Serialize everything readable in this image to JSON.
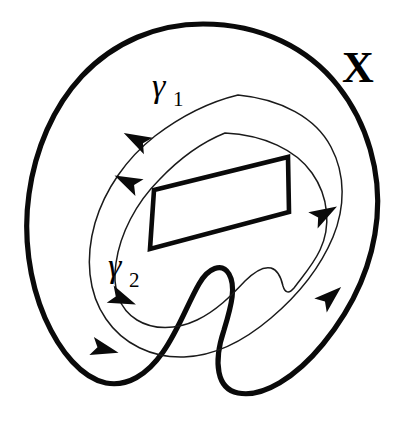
{
  "figure": {
    "background_color": "#ffffff",
    "stroke_color": "#0a0a0a",
    "width": 409,
    "height": 431
  },
  "labels": {
    "space": {
      "name": "X",
      "text": "X",
      "x": 342,
      "y": 82,
      "description": "label of the ambient topological space"
    },
    "loop_outer": {
      "name": "gamma-1",
      "symbol": "γ",
      "subscript": "1",
      "x": 152,
      "y": 97,
      "description": "outer closed curve label"
    },
    "loop_inner": {
      "name": "gamma-2",
      "symbol": "γ",
      "subscript": "2",
      "x": 108,
      "y": 277,
      "description": "inner closed curve label"
    }
  },
  "shapes": {
    "space_boundary": {
      "name": "space-outline",
      "stroke_width": 5.2,
      "path": "M 203 24 C 262 24 309 49 338 86 C 368 124 381 173 377 218 C 373 263 354 306 323 344 C 296 377 263 398 238 393 C 217 389 213 363 224 330 C 232 304 236 286 229 274 C 222 262 208 268 199 284 C 188 303 178 331 163 352 C 147 375 127 387 106 383 C 82 378 60 352 45 318 C 29 281 23 236 29 194 C 35 150 53 107 82 76 C 114 42 157 24 203 24 Z"
    },
    "hole": {
      "name": "hole-quadrilateral",
      "stroke_width": 4.6,
      "path": "M 154 190 L 288 157 L 289 212 L 150 249 Z",
      "corners": [
        [
          154,
          190
        ],
        [
          288,
          157
        ],
        [
          289,
          212
        ],
        [
          150,
          249
        ]
      ]
    },
    "loop_outer_path": {
      "name": "gamma-1-curve",
      "stroke_width": 1.5,
      "path": "M 238 95 C 281 99 316 118 331 147 C 346 175 345 208 333 237 C 320 268 297 296 271 318 C 244 341 214 356 184 357 C 152 358 123 344 106 319 C 88 293 85 258 95 223 C 105 189 127 158 155 136 C 180 117 209 102 238 95 Z"
    },
    "loop_inner_path": {
      "name": "gamma-2-curve",
      "stroke_width": 1.5,
      "path": "M 225 133 C 264 135 296 150 312 173 C 329 197 331 227 320 250 C 313 265 302 277 294 288 C 289 294 285 293 283 286 C 281 277 278 270 271 268 C 263 266 254 272 245 281 C 231 296 216 311 197 320 C 176 330 153 330 137 320 C 119 309 112 288 116 263 C 120 234 136 203 159 180 C 177 161 200 143 225 133 Z"
    }
  },
  "arrows": {
    "description": "arrowheads marking the orientation of each loop",
    "items": [
      {
        "name": "gamma-1-arrow-upper-left",
        "on_loop": "gamma-1",
        "x": 137,
        "y": 140,
        "angle_deg": 208,
        "size": 15,
        "direction": "down-left"
      },
      {
        "name": "gamma-1-arrow-lower-left",
        "on_loop": "gamma-1",
        "x": 104,
        "y": 349,
        "angle_deg": 14,
        "size": 15,
        "direction": "right"
      },
      {
        "name": "gamma-1-arrow-right",
        "on_loop": "gamma-1",
        "x": 330,
        "y": 297,
        "angle_deg": 318,
        "size": 15,
        "direction": "up-right"
      },
      {
        "name": "gamma-2-arrow-upper-left",
        "on_loop": "gamma-2",
        "x": 128,
        "y": 182,
        "angle_deg": 206,
        "size": 15,
        "direction": "down-left"
      },
      {
        "name": "gamma-2-arrow-lower-left",
        "on_loop": "gamma-2",
        "x": 122,
        "y": 299,
        "angle_deg": 22,
        "size": 15,
        "direction": "down-right"
      },
      {
        "name": "gamma-2-arrow-right",
        "on_loop": "gamma-2",
        "x": 324,
        "y": 214,
        "angle_deg": 330,
        "size": 15,
        "direction": "up-right"
      }
    ]
  }
}
